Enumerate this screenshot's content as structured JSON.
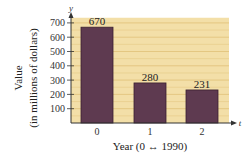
{
  "chart_data": {
    "type": "bar",
    "title": "",
    "xlabel": "Year (0 ↔ 1990)",
    "ylabel_line1": "Value",
    "ylabel_line2": "(in millions of dollars)",
    "x_axis_letter": "t",
    "y_axis_letter": "y",
    "categories": [
      "0",
      "1",
      "2"
    ],
    "values": [
      670,
      280,
      231
    ],
    "data_labels": [
      "670",
      "280",
      "231"
    ],
    "yticks": [
      100,
      200,
      300,
      400,
      500,
      600,
      700
    ],
    "ytick_labels": [
      "100",
      "200",
      "300",
      "400",
      "500",
      "600",
      "700"
    ],
    "ylim": [
      0,
      750
    ],
    "grid": true,
    "legend": null
  },
  "colors": {
    "plot_background": "#f3dfa8",
    "gridline": "#e2c47e",
    "bar_fill": "#5e3a50",
    "bar_edge": "#3a2030",
    "axis": "#333333"
  }
}
